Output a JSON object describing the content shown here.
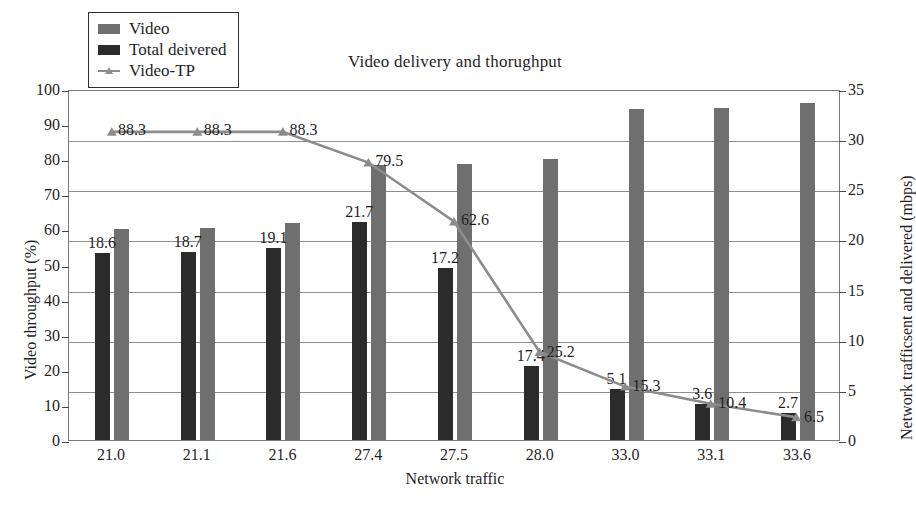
{
  "chart_data": {
    "type": "bar",
    "title": "Video delivery and thorughput",
    "xlabel": "Network traffic",
    "ylabel": "Video throughput (%)",
    "y2label": "Network trafficsent and delivered (mbps)",
    "categories": [
      "21.0",
      "21.1",
      "21.6",
      "27.4",
      "27.5",
      "28.0",
      "33.0",
      "33.1",
      "33.6"
    ],
    "ylim": [
      0,
      100
    ],
    "y2lim": [
      0,
      35
    ],
    "yticks": [
      0,
      10,
      20,
      30,
      40,
      50,
      60,
      70,
      80,
      90,
      100
    ],
    "y2ticks": [
      0,
      5,
      10,
      15,
      20,
      25,
      30,
      35
    ],
    "grid": true,
    "legend_position": "top-left",
    "series": [
      {
        "name": "Video",
        "kind": "bar",
        "axis": "right",
        "color": "#6f6f6f",
        "values": [
          21.0,
          21.1,
          21.6,
          27.4,
          27.5,
          28.0,
          33.0,
          33.1,
          33.6
        ],
        "labels": [
          "",
          "",
          "",
          "",
          "",
          "",
          "",
          "",
          ""
        ]
      },
      {
        "name": "Total deivered",
        "kind": "bar",
        "axis": "right",
        "color": "#2b2b2b",
        "values": [
          18.6,
          18.7,
          19.1,
          21.7,
          17.2,
          7.4,
          5.1,
          3.6,
          2.7
        ],
        "labels": [
          "18.6",
          "18.7",
          "19.1",
          "21.7",
          "17.2",
          "17.4",
          "5.1",
          "3.6",
          "2.7"
        ]
      },
      {
        "name": "Video-TP",
        "kind": "line",
        "axis": "left",
        "color": "#8c8c8c",
        "values": [
          88.3,
          88.3,
          88.3,
          79.5,
          62.6,
          25.2,
          15.3,
          10.4,
          6.5
        ],
        "labels": [
          "88.3",
          "88.3",
          "88.3",
          "79.5",
          "62.6",
          "25.2",
          "15.3",
          "10.4",
          "6.5"
        ]
      }
    ]
  },
  "legend": {
    "items": [
      {
        "label": "Video",
        "marker": "swatch",
        "color": "#6f6f6f"
      },
      {
        "label": "Total deivered",
        "marker": "swatch",
        "color": "#2b2b2b"
      },
      {
        "label": "Video-TP",
        "marker": "line",
        "color": "#8c8c8c"
      }
    ]
  }
}
